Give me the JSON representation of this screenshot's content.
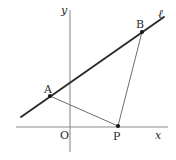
{
  "figure": {
    "type": "geometry-diagram",
    "width": 176,
    "height": 160,
    "background_color": "#ffffff",
    "axis_color": "#8c8c8c",
    "line_color": "#2b2b2b",
    "segment_color": "#6e6e6e",
    "label_color": "#2b2b2b"
  },
  "axes": {
    "x_label": "x",
    "y_label": "y",
    "origin_label": "O",
    "x_axis": {
      "x1": 16,
      "y1": 127,
      "x2": 168,
      "y2": 127
    },
    "y_axis": {
      "x1": 70,
      "y1": 10,
      "x2": 70,
      "y2": 152
    }
  },
  "line": {
    "label": "ℓ",
    "x1": 21,
    "y1": 117,
    "x2": 164,
    "y2": 17
  },
  "points": [
    {
      "name": "A",
      "label": "A",
      "x": 50,
      "y": 96,
      "label_x": 44,
      "label_y": 84
    },
    {
      "name": "B",
      "label": "B",
      "x": 142,
      "y": 32,
      "label_x": 136,
      "label_y": 19
    },
    {
      "name": "P",
      "label": "P",
      "x": 118,
      "y": 126,
      "label_x": 113,
      "label_y": 131
    }
  ],
  "segments": [
    {
      "name": "AP",
      "from": "A",
      "to": "P",
      "x1": 50,
      "y1": 96,
      "x2": 118,
      "y2": 126
    },
    {
      "name": "BP",
      "from": "B",
      "to": "P",
      "x1": 142,
      "y1": 32,
      "x2": 118,
      "y2": 126
    }
  ],
  "labels": {
    "y_axis_label": {
      "text": "y",
      "x": 61,
      "y": 5
    },
    "x_axis_label": {
      "text": "x",
      "x": 155,
      "y": 130
    },
    "origin": {
      "text": "O",
      "x": 60,
      "y": 130
    },
    "line_ell": {
      "text": "ℓ",
      "x": 158,
      "y": 8
    }
  }
}
